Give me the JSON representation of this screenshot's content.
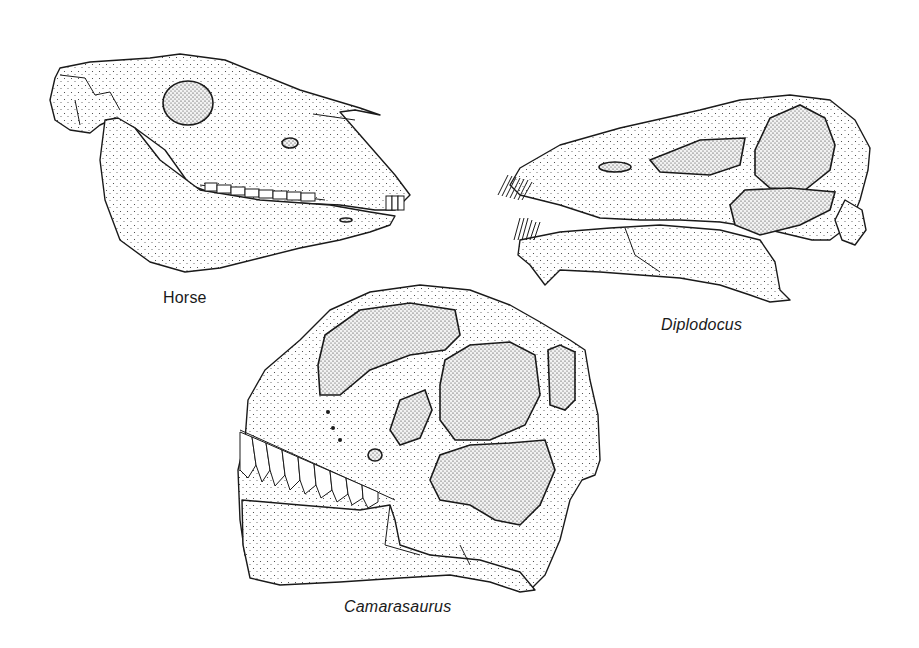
{
  "figure": {
    "background": "#ffffff",
    "ink_color": "#1a1a1a",
    "style": "stippled pen-and-ink skull illustrations, lateral view"
  },
  "specimens": [
    {
      "id": "horse",
      "label": "Horse",
      "italic": false,
      "label_position": {
        "x": 163,
        "y": 289
      }
    },
    {
      "id": "diplodocus",
      "label": "Diplodocus",
      "italic": true,
      "label_position": {
        "x": 661,
        "y": 316
      }
    },
    {
      "id": "camarasaurus",
      "label": "Camarasaurus",
      "italic": true,
      "label_position": {
        "x": 344,
        "y": 598
      }
    }
  ]
}
